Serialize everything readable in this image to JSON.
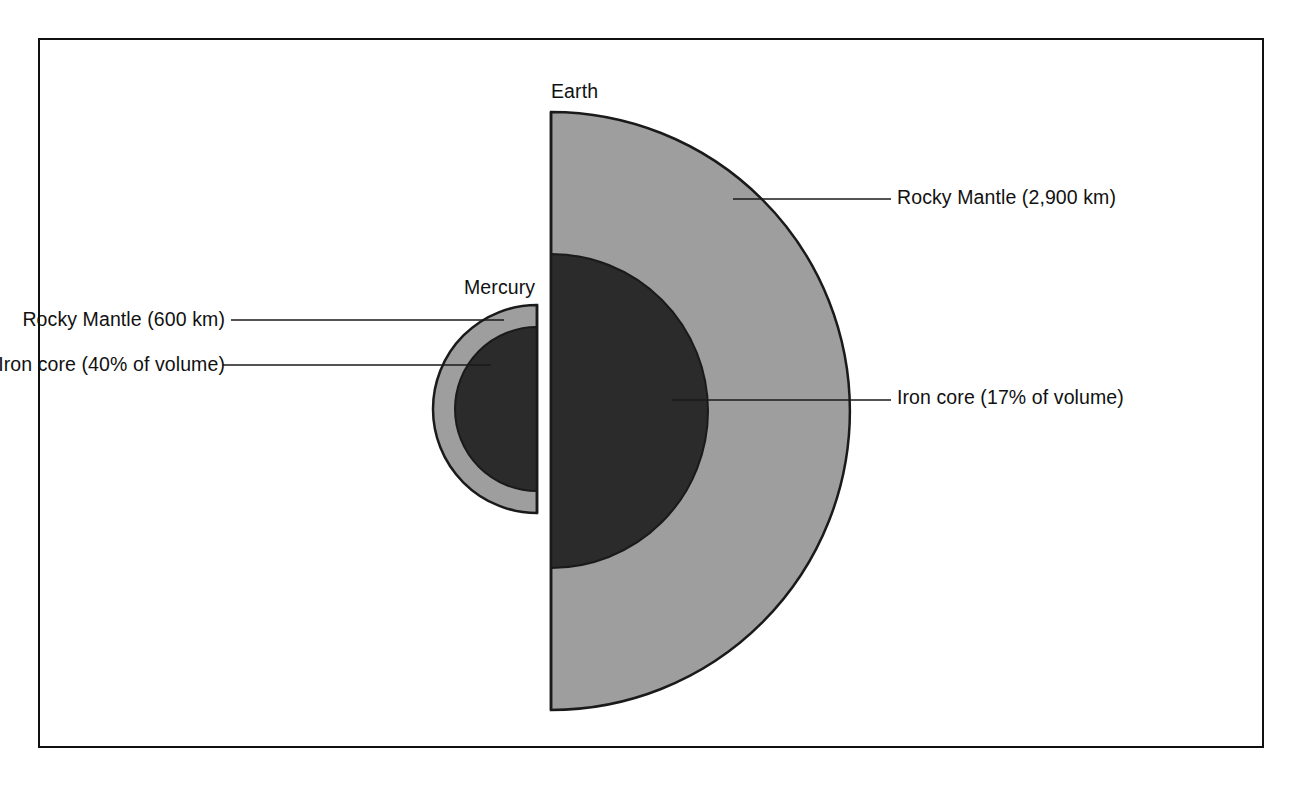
{
  "figure": {
    "background_color": "#ffffff",
    "frame_color": "#101010"
  },
  "palette": {
    "mantle_fill": "#9e9e9e",
    "core_fill": "#2b2b2b",
    "outline": "#1a1a1a",
    "leader_line": "#1a1a1a",
    "text": "#111111"
  },
  "bodies": [
    {
      "id": "earth",
      "name": "Earth",
      "orientation": "right-facing-hemisphere",
      "layers": [
        {
          "id": "earth-mantle",
          "name": "Rocky Mantle",
          "label": "Rocky Mantle (2,900 km)",
          "thickness_km": 2900,
          "fill": "#9e9e9e"
        },
        {
          "id": "earth-core",
          "name": "Iron core",
          "label": "Iron core (17% of volume)",
          "volume_percent": 17,
          "fill": "#2b2b2b"
        }
      ]
    },
    {
      "id": "mercury",
      "name": "Mercury",
      "orientation": "left-facing-hemisphere",
      "layers": [
        {
          "id": "mercury-mantle",
          "name": "Rocky Mantle",
          "label": "Rocky Mantle (600 km)",
          "thickness_km": 600,
          "fill": "#9e9e9e"
        },
        {
          "id": "mercury-core",
          "name": "Iron core",
          "label": "Iron core (40% of volume)",
          "volume_percent": 40,
          "fill": "#2b2b2b"
        }
      ]
    }
  ],
  "labels": {
    "earth_title": "Earth",
    "mercury_title": "Mercury",
    "earth_mantle": "Rocky Mantle (2,900 km)",
    "earth_core": "Iron core (17% of volume)",
    "mercury_mantle": "Rocky Mantle (600 km)",
    "mercury_core": "Iron core (40% of volume)"
  }
}
